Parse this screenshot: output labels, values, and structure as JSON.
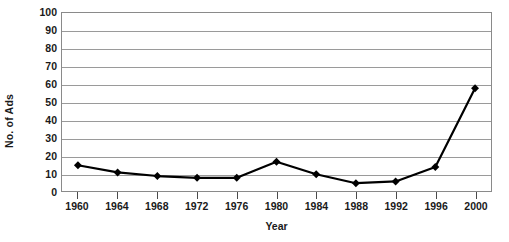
{
  "chart_data": {
    "type": "line",
    "title": "",
    "xlabel": "Year",
    "ylabel": "No. of Ads",
    "x": [
      1960,
      1964,
      1968,
      1972,
      1976,
      1980,
      1984,
      1988,
      1992,
      1996,
      2000
    ],
    "x_tick_labels": [
      "1960",
      "1964",
      "1968",
      "1972",
      "1976",
      "1980",
      "1984",
      "1988",
      "1992",
      "1996",
      "2000"
    ],
    "values": [
      15,
      11,
      9,
      8,
      8,
      17,
      10,
      5,
      6,
      14,
      58
    ],
    "y_tick_labels": [
      "0",
      "10",
      "20",
      "30",
      "40",
      "50",
      "60",
      "70",
      "80",
      "90",
      "100"
    ],
    "y_ticks": [
      0,
      10,
      20,
      30,
      40,
      50,
      60,
      70,
      80,
      90,
      100
    ],
    "ylim": [
      0,
      100
    ],
    "grid": true,
    "legend": false,
    "marker": "diamond",
    "series_color": "#000000",
    "gridline_color": "#9a9a9a",
    "axis_color": "#8a8a8a",
    "background_color": "#ffffff"
  }
}
